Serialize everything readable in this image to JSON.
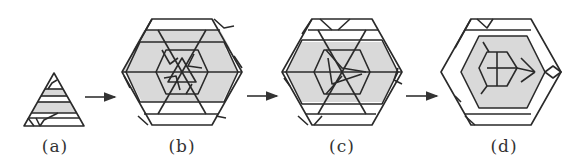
{
  "figure": {
    "panels": [
      {
        "id": "a",
        "label": "(a)",
        "shape": "triangle",
        "cx": 54
      },
      {
        "id": "b",
        "label": "(b)",
        "shape": "hexagon",
        "cx": 182
      },
      {
        "id": "c",
        "label": "(c)",
        "shape": "hexagon",
        "cx": 342
      },
      {
        "id": "d",
        "label": "(d)",
        "shape": "hexagon",
        "cx": 501
      }
    ],
    "arrows": [
      {
        "from": "a",
        "to": "b"
      },
      {
        "from": "b",
        "to": "c"
      },
      {
        "from": "c",
        "to": "d"
      }
    ],
    "colors": {
      "stroke": "#2a2a2a",
      "shade": "#d9d9d9",
      "background": "#ffffff"
    }
  }
}
